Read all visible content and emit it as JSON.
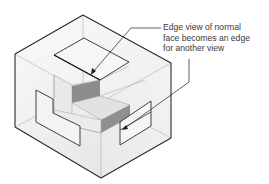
{
  "figure": {
    "callout": {
      "lines": [
        "Edge view of normal",
        "face becomes an edge",
        "for another view"
      ]
    },
    "colors": {
      "outline": "#2a2a2a",
      "faint_line": "#a8a8a8",
      "box_fill": "#f2f2f2",
      "shaded_face": "#8a8a8a",
      "light_face": "#e4e4e4",
      "leader": "#3a3a3a"
    }
  }
}
